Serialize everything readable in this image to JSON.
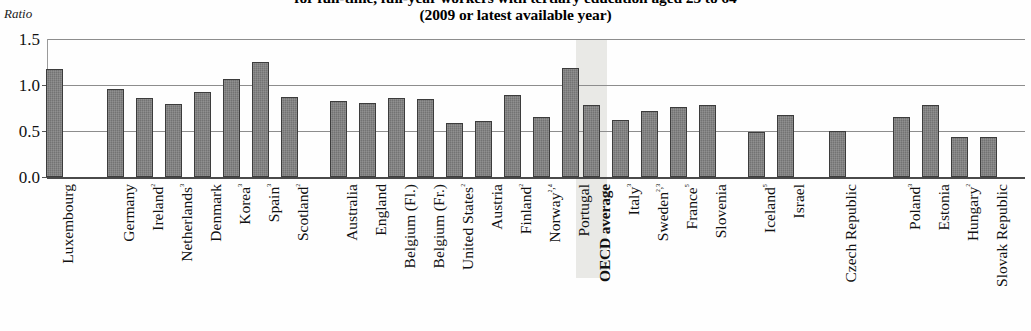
{
  "chart": {
    "title_line1": "for full-time, full-year workers with tertiary education aged 25 to 64",
    "title_line2": "(2009 or latest available year)",
    "ylabel": "Ratio",
    "yticks": [
      "1.5",
      "1.0",
      "0.5",
      "0.0"
    ],
    "highlight_label": "OECD average",
    "highlight_color": "#e9e9e6",
    "bar_color": "#737373",
    "bar_outline": "#3c3c3c",
    "gridline_color": "#8d8d8d"
  },
  "chart_data": {
    "type": "bar",
    "title": "for full-time, full-year workers with tertiary education aged 25 to 64 (2009 or latest available year)",
    "xlabel": "",
    "ylabel": "Ratio",
    "ylim": [
      0.0,
      1.5
    ],
    "yticks": [
      0.0,
      0.5,
      1.0,
      1.5
    ],
    "grid": true,
    "legend": "none",
    "orientation": "vertical",
    "highlight_category": "OECD average",
    "categories": [
      "Luxembourg",
      "Germany",
      "Ireland²",
      "Netherlands³",
      "Denmark",
      "Korea³",
      "Spain³",
      "Scotland²",
      "Australia",
      "England",
      "Belgium (Fl.)",
      "Belgium (Fr.)",
      "United States²",
      "Austria",
      "Finland²",
      "Norway²,⁴",
      "Portugal",
      "OECD average",
      "Italy³",
      "Sweden²,³",
      "France⁵",
      "Slovenia",
      "Iceland⁵",
      "Israel",
      "Czech Republic",
      "Poland³",
      "Estonia",
      "Hungary²",
      "Slovak Republic"
    ],
    "values": [
      1.17,
      0.96,
      0.86,
      0.79,
      0.92,
      1.07,
      1.25,
      0.87,
      0.83,
      0.8,
      0.86,
      0.85,
      0.59,
      0.61,
      0.89,
      0.65,
      1.18,
      0.78,
      0.62,
      0.72,
      0.76,
      0.78,
      0.49,
      0.67,
      0.5,
      0.65,
      0.78,
      0.44,
      0.43
    ],
    "bar_x": [
      46,
      107,
      136,
      165,
      194,
      223,
      252,
      281,
      330,
      359,
      388,
      417,
      446,
      475,
      504,
      533,
      562,
      583,
      612,
      641,
      670,
      699,
      748,
      777,
      829,
      893,
      922,
      951,
      980
    ]
  }
}
